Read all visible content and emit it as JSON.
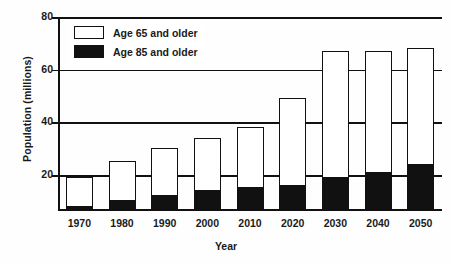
{
  "chart_data": {
    "type": "bar",
    "title": "",
    "xlabel": "Year",
    "ylabel": "Population (millions)",
    "categories": [
      "1970",
      "1980",
      "1990",
      "2000",
      "2010",
      "2020",
      "2030",
      "2040",
      "2050"
    ],
    "ylim": [
      0,
      80
    ],
    "yticks": [
      0,
      20,
      40,
      60,
      80
    ],
    "ytick_labels": [
      "20",
      "40",
      "60",
      "80"
    ],
    "grid": true,
    "legend_position": "upper-left-inside",
    "stacked": true,
    "series": [
      {
        "name": "Age 65 and older",
        "style": "hollow",
        "values": [
          20,
          26,
          31,
          35,
          39,
          50,
          68,
          68,
          69
        ]
      },
      {
        "name": "Age 85 and older",
        "style": "filled",
        "values": [
          2,
          4,
          6,
          8,
          9,
          10,
          13,
          15,
          18
        ]
      }
    ]
  },
  "legend": {
    "items": [
      {
        "label": "Age 65 and older",
        "swatch": "hollow"
      },
      {
        "label": "Age 85 and older",
        "swatch": "filled"
      }
    ]
  },
  "axes": {
    "y_title": "Population (millions)",
    "x_title": "Year"
  }
}
